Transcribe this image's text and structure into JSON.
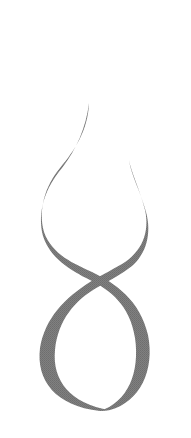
{
  "figure": {
    "colors": {
      "background": "#ffffff",
      "stroke": "#7a7a7a"
    }
  }
}
